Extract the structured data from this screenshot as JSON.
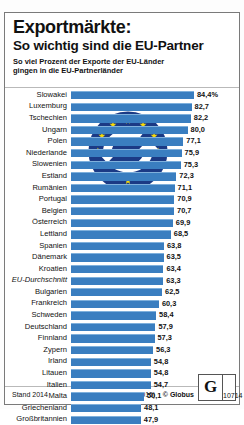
{
  "header": {
    "title_line1": "Exportmärkte:",
    "title_line2": "So wichtig sind die EU-Partner",
    "subtitle_line1": "So viel Prozent der Exporte der EU-Länder",
    "subtitle_line2": "gingen in die EU-Partnerländer"
  },
  "footer": {
    "stand": "Stand 2014",
    "source": "Quelle: Eurostat (2015)",
    "copyright": "© Globus",
    "logo_letter": "G",
    "logo_number": "10714"
  },
  "colors": {
    "bar": "#3a7ec0",
    "bar_highlight": "#7fb0dc",
    "emblem_bg": "#1b3a85",
    "star": "#f5d90a",
    "text": "#111111"
  },
  "chart_data": {
    "type": "bar",
    "orientation": "horizontal",
    "title": "Exportmärkte: So wichtig sind die EU-Partner",
    "subtitle": "So viel Prozent der Exporte der EU-Länder gingen in die EU-Partnerländer",
    "xlabel": "",
    "ylabel": "",
    "unit": "%",
    "xlim": [
      0,
      84.4
    ],
    "grid": false,
    "legend": false,
    "value_suffix_first": "%",
    "categories": [
      "Slowakei",
      "Luxemburg",
      "Tschechien",
      "Ungarn",
      "Polen",
      "Niederlande",
      "Slowenien",
      "Estland",
      "Rumänien",
      "Portugal",
      "Belgien",
      "Österreich",
      "Lettland",
      "Spanien",
      "Dänemark",
      "Kroatien",
      "EU-Durchschnitt",
      "Bulgarien",
      "Frankreich",
      "Schweden",
      "Deutschland",
      "Finnland",
      "Zypern",
      "Irland",
      "Litauen",
      "Italien",
      "Malta",
      "Griechenland",
      "Großbritannien"
    ],
    "values": [
      84.4,
      82.7,
      82.2,
      80.0,
      77.1,
      75.9,
      75.3,
      72.3,
      71.1,
      70.9,
      70.7,
      69.9,
      68.5,
      63.8,
      63.5,
      63.4,
      63.3,
      62.5,
      60.3,
      58.4,
      57.9,
      57.3,
      56.3,
      54.8,
      54.8,
      54.7,
      50.1,
      48.1,
      47.9
    ],
    "value_labels": [
      "84,4%",
      "82,7",
      "82,2",
      "80,0",
      "77,1",
      "75,9",
      "75,3",
      "72,3",
      "71,1",
      "70,9",
      "70,7",
      "69,9",
      "68,5",
      "63,8",
      "63,5",
      "63,4",
      "63,3",
      "62,5",
      "60,3",
      "58,4",
      "57,9",
      "57,3",
      "56,3",
      "54,8",
      "54,8",
      "54,7",
      "50,1",
      "48,1",
      "47,9"
    ],
    "emphasis_italic_index": 16
  }
}
